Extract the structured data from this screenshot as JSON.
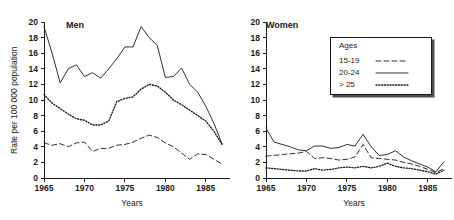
{
  "figure": {
    "xlabel": "Years",
    "ylabel": "Rate per 100 000 population"
  },
  "legend": {
    "title": "Ages",
    "position": "inside-right-panel-top",
    "entries": [
      {
        "label": "15-19",
        "style": "dashed",
        "icon": "dashed-line-icon"
      },
      {
        "label": "20-24",
        "style": "solid",
        "icon": "solid-line-icon"
      },
      {
        "label": "> 25",
        "style": "dotted",
        "icon": "dotted-line-icon"
      }
    ]
  },
  "panels": [
    {
      "key": "men",
      "title": "Men"
    },
    {
      "key": "women",
      "title": "Women"
    }
  ],
  "axes": {
    "yticks": [
      0,
      2,
      4,
      6,
      8,
      10,
      12,
      14,
      16,
      18,
      20
    ],
    "ytick_labels": [
      "0",
      "2",
      "4",
      "6",
      "8",
      "10",
      "12",
      "14",
      "16",
      "18",
      "20"
    ],
    "xticks": [
      1965,
      1970,
      1975,
      1980,
      1985
    ],
    "xtick_labels": [
      "1965",
      "1970",
      "1975",
      "1980",
      "1985"
    ]
  },
  "chart_data": [
    {
      "type": "line",
      "title": "Men",
      "xlabel": "Years",
      "ylabel": "Rate per 100 000 population",
      "xlim": [
        1965,
        1987
      ],
      "ylim": [
        0,
        20
      ],
      "grid": false,
      "legend_position": "right panel, upper area",
      "x": [
        1965,
        1966,
        1967,
        1968,
        1969,
        1970,
        1971,
        1972,
        1973,
        1974,
        1975,
        1976,
        1977,
        1978,
        1979,
        1980,
        1981,
        1982,
        1983,
        1984,
        1985,
        1986,
        1987
      ],
      "series": [
        {
          "name": "20-24",
          "style": "solid",
          "values": [
            19.4,
            16.0,
            12.2,
            14.0,
            14.5,
            13.0,
            13.5,
            12.8,
            14.0,
            15.3,
            16.8,
            16.8,
            19.4,
            18.0,
            17.0,
            12.9,
            13.0,
            14.1,
            12.0,
            11.0,
            9.2,
            7.0,
            4.4
          ]
        },
        {
          "name": "> 25",
          "style": "dotted",
          "values": [
            10.7,
            9.6,
            8.9,
            8.2,
            7.6,
            7.4,
            6.8,
            6.8,
            7.3,
            9.8,
            10.2,
            10.4,
            11.4,
            12.0,
            11.8,
            11.0,
            10.0,
            9.4,
            8.7,
            8.0,
            7.3,
            6.0,
            4.3
          ]
        },
        {
          "name": "15-19",
          "style": "dashed",
          "values": [
            4.5,
            4.2,
            4.4,
            4.0,
            4.5,
            4.6,
            3.4,
            3.8,
            3.8,
            4.2,
            4.3,
            4.6,
            5.1,
            5.5,
            5.2,
            4.5,
            4.0,
            3.2,
            2.4,
            3.1,
            3.0,
            2.4,
            1.8
          ]
        }
      ]
    },
    {
      "type": "line",
      "title": "Women",
      "xlabel": "Years",
      "ylabel": "Rate per 100 000 population",
      "xlim": [
        1965,
        1987
      ],
      "ylim": [
        0,
        20
      ],
      "grid": false,
      "legend_position": "upper right inside axes",
      "x": [
        1965,
        1966,
        1967,
        1968,
        1969,
        1970,
        1971,
        1972,
        1973,
        1974,
        1975,
        1976,
        1977,
        1978,
        1979,
        1980,
        1981,
        1982,
        1983,
        1984,
        1985,
        1986,
        1987
      ],
      "series": [
        {
          "name": "20-24",
          "style": "solid",
          "values": [
            6.4,
            4.6,
            4.3,
            4.0,
            3.6,
            3.5,
            4.1,
            4.1,
            3.8,
            3.9,
            4.3,
            4.1,
            5.6,
            4.0,
            2.9,
            3.0,
            3.5,
            2.7,
            2.2,
            1.8,
            1.4,
            0.8,
            2.1
          ]
        },
        {
          "name": "15-19",
          "style": "dashed",
          "values": [
            2.8,
            2.9,
            3.0,
            3.1,
            3.2,
            3.4,
            2.5,
            2.6,
            2.5,
            2.3,
            2.4,
            2.7,
            4.3,
            2.6,
            2.5,
            2.4,
            2.3,
            2.0,
            1.8,
            1.5,
            1.1,
            0.7,
            1.2
          ]
        },
        {
          "name": "> 25",
          "style": "dotted",
          "values": [
            1.3,
            1.2,
            1.1,
            1.0,
            0.9,
            0.9,
            1.2,
            1.0,
            1.1,
            1.3,
            1.4,
            1.3,
            1.5,
            1.3,
            1.5,
            1.9,
            1.5,
            1.3,
            1.2,
            1.0,
            0.8,
            0.5,
            1.0
          ]
        }
      ]
    }
  ],
  "colors": {
    "ink": "#1a1a1a",
    "background": "#ffffff",
    "legend_shadow": "#4d4d4d"
  }
}
